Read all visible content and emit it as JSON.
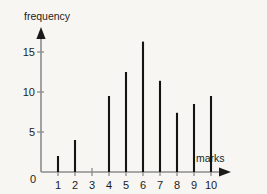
{
  "chart_data": {
    "type": "bar",
    "title": "",
    "subtitle": "",
    "xlabel": "marks",
    "ylabel": "frequency",
    "categories": [
      "1",
      "2",
      "3",
      "4",
      "5",
      "6",
      "7",
      "8",
      "9",
      "10"
    ],
    "values": [
      2,
      4,
      0,
      9.5,
      12.5,
      16.3,
      11.4,
      7.4,
      8.5,
      9.5
    ],
    "x": [
      1,
      2,
      3,
      4,
      5,
      6,
      7,
      8,
      9,
      10
    ],
    "xlim": [
      0,
      10
    ],
    "ylim": [
      0,
      17
    ],
    "x_tick_labels": [
      "0",
      "1",
      "2",
      "3",
      "4",
      "5",
      "6",
      "7",
      "8",
      "9",
      "10"
    ],
    "y_tick_labels": [
      "0",
      "5",
      "10",
      "15"
    ],
    "y_tick_values": [
      0,
      5,
      10,
      15
    ],
    "grid": false,
    "legend": null,
    "annotations": [],
    "style": {
      "background": "#f7f6f2",
      "axis_color": "#8c8c8c",
      "bar_color": "#141414",
      "text_color": "#1c1c1c",
      "arrow_color": "#1a1a1a"
    }
  },
  "axes": {
    "y_axis_title": "frequency",
    "x_axis_title": "marks",
    "origin_label": "0"
  }
}
